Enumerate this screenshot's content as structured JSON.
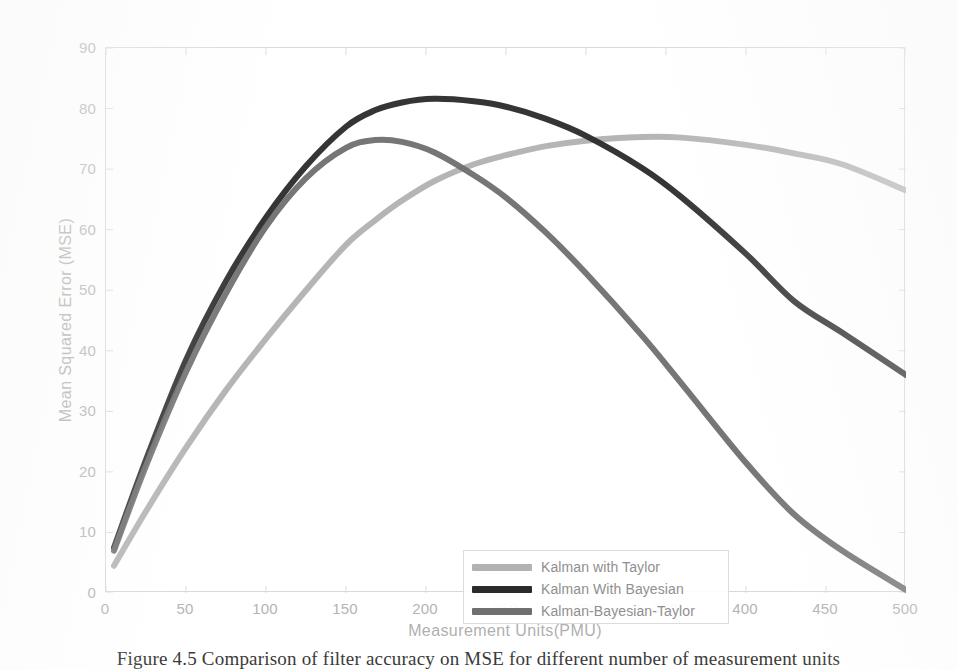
{
  "figure": {
    "caption": "Figure 4.5 Comparison of filter accuracy on MSE for different number of measurement units"
  },
  "chart_data": {
    "type": "line",
    "title": "",
    "xlabel": "Measurement Units(PMU)",
    "ylabel": "Mean Squared Error (MSE)",
    "xlim": [
      0,
      500
    ],
    "ylim": [
      0,
      90
    ],
    "xticks": [
      0,
      50,
      100,
      150,
      200,
      250,
      300,
      350,
      400,
      450,
      500
    ],
    "yticks": [
      0,
      10,
      20,
      30,
      40,
      50,
      60,
      70,
      80,
      90
    ],
    "grid": false,
    "legend_position": "lower center inside axes",
    "x": [
      5,
      25,
      50,
      75,
      100,
      125,
      150,
      168,
      185,
      205,
      230,
      250,
      275,
      300,
      335,
      360,
      400,
      430,
      460,
      500
    ],
    "series": [
      {
        "name": "Kalman with Taylor",
        "color": "#b2b2b2",
        "values": [
          4.5,
          13.5,
          24.0,
          33.5,
          42.0,
          50.0,
          57.5,
          61.5,
          64.8,
          68.0,
          70.8,
          72.3,
          73.8,
          74.7,
          75.3,
          75.2,
          74.0,
          72.6,
          70.8,
          66.5
        ]
      },
      {
        "name": "Kalman With Bayesian",
        "color": "#2b2b2b",
        "values": [
          7.5,
          22.0,
          38.5,
          51.5,
          62.0,
          70.5,
          77.0,
          79.7,
          81.0,
          81.6,
          81.2,
          80.3,
          78.3,
          75.5,
          70.2,
          65.3,
          56.0,
          48.2,
          43.0,
          36.0
        ]
      },
      {
        "name": "Kalman-Bayesian-Taylor",
        "color": "#6f6f6f",
        "values": [
          7.0,
          21.0,
          36.5,
          49.5,
          60.5,
          68.5,
          73.5,
          74.8,
          74.5,
          72.8,
          69.0,
          65.3,
          59.5,
          52.8,
          42.5,
          34.5,
          21.5,
          13.0,
          7.0,
          0.5
        ]
      }
    ]
  },
  "legend": {
    "items": [
      {
        "label": "Kalman with Taylor",
        "color": "#b2b2b2"
      },
      {
        "label": "Kalman With Bayesian",
        "color": "#2b2b2b"
      },
      {
        "label": "Kalman-Bayesian-Taylor",
        "color": "#6f6f6f"
      }
    ]
  }
}
